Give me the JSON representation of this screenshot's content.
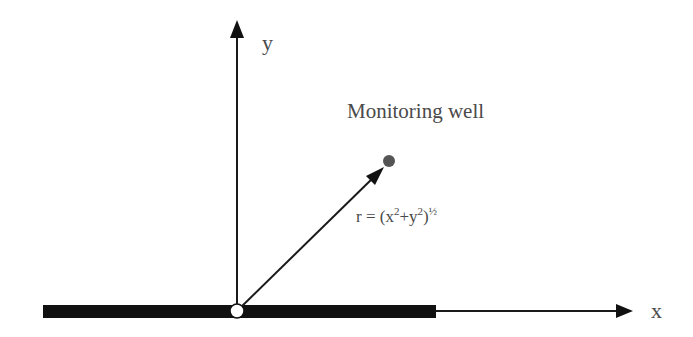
{
  "diagram": {
    "axes": {
      "x_label": "x",
      "y_label": "y"
    },
    "well": {
      "label": "Monitoring well",
      "color": "#555555"
    },
    "radius_formula": {
      "prefix": "r = (x",
      "sup1": "2",
      "mid": "+y",
      "sup2": "2",
      "close": ")",
      "exponent": "½"
    },
    "colors": {
      "line": "#1a1a1a",
      "thick_bar": "#111111",
      "text": "#4a4a4a",
      "origin_fill": "#ffffff"
    }
  }
}
